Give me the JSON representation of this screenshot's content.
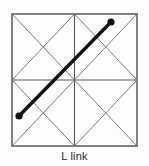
{
  "figure": {
    "caption": "L link",
    "colors": {
      "background": "#fdfdfd",
      "border": "#4a4a4a",
      "grid": "#5a5a5a",
      "diagonal": "#6e6e6e",
      "link": "#111111",
      "caption_text": "#2b2b2b"
    },
    "lattice": {
      "name": "square-lattice-with-quadrant-diagonals",
      "outer_square": {
        "x": 12,
        "y": 14,
        "width": 125,
        "height": 132
      },
      "divisions": 2,
      "midline_vertical_x": 74.5,
      "midline_horizontal_y": 80,
      "quadrant_diagonals": "both",
      "border_width": 1.4,
      "grid_width": 1.1,
      "diagonal_width": 0.9
    },
    "link": {
      "label": "L link",
      "start": {
        "x": 19,
        "y": 116
      },
      "end": {
        "x": 111,
        "y": 22
      },
      "stroke_width": 3.4,
      "endpoint_radius": 3.6,
      "endpoints": 2
    }
  }
}
